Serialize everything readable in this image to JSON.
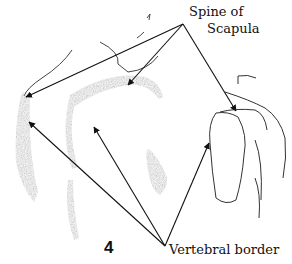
{
  "figure": {
    "number": "4",
    "labels": {
      "spine_of_scapula_line1": "Spine of",
      "spine_of_scapula_line2": "Scapula",
      "vertebral_border": "Vertebral border"
    },
    "colors": {
      "ink": "#111111",
      "shading": "#555555",
      "background": "#ffffff"
    }
  }
}
